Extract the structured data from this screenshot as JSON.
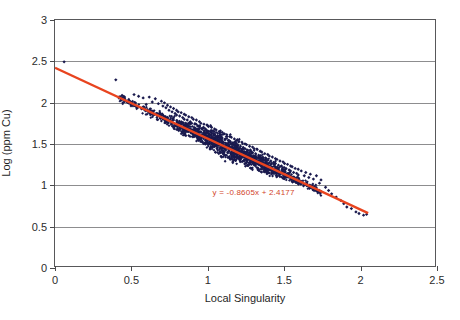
{
  "chart_data": {
    "type": "scatter",
    "title": "",
    "xlabel": "Local Singularity",
    "ylabel": "Log (ppm Cu)",
    "xlim": [
      0,
      2.5
    ],
    "ylim": [
      0,
      3
    ],
    "xticks": [
      "0",
      "0.5",
      "1",
      "1.5",
      "2",
      "2.5"
    ],
    "xtick_values": [
      0,
      0.5,
      1,
      1.5,
      2,
      2.5
    ],
    "yticks": [
      "0",
      "0.5",
      "1",
      "1.5",
      "2",
      "2.5",
      "3"
    ],
    "ytick_values": [
      0,
      0.5,
      1,
      1.5,
      2,
      2.5,
      3
    ],
    "grid": "horizontal",
    "legend": "none",
    "point_color": "#1a1a4e",
    "trendline_color": "#e8441f",
    "trendline": {
      "equation": "y = -0.8605x + 2.4177",
      "slope": -0.8605,
      "intercept": 2.4177,
      "x_start": 0.0,
      "x_end": 2.06
    },
    "annotation": {
      "text": "y = -0.8605x + 2.4177",
      "x": 1.3,
      "y": 0.92
    },
    "series": [
      {
        "name": "Log (ppm Cu) vs Local Singularity",
        "marker": "diamond",
        "points": [
          [
            0.06,
            2.49
          ],
          [
            0.4,
            2.27
          ],
          [
            0.46,
            2.03
          ],
          [
            0.52,
            2.09
          ],
          [
            0.55,
            2.07
          ],
          [
            0.58,
            2.05
          ],
          [
            0.6,
            1.97
          ],
          [
            0.62,
            2.06
          ],
          [
            0.64,
            2.0
          ],
          [
            0.66,
            2.04
          ],
          [
            0.68,
            1.98
          ],
          [
            0.7,
            2.01
          ],
          [
            0.71,
            1.95
          ],
          [
            0.72,
            1.99
          ],
          [
            0.73,
            1.93
          ],
          [
            0.74,
            1.96
          ],
          [
            0.75,
            1.9
          ],
          [
            0.76,
            1.94
          ],
          [
            0.77,
            1.88
          ],
          [
            0.78,
            1.92
          ],
          [
            0.79,
            1.86
          ],
          [
            0.8,
            1.9
          ],
          [
            0.8,
            1.84
          ],
          [
            0.81,
            1.88
          ],
          [
            0.82,
            1.83
          ],
          [
            0.83,
            1.87
          ],
          [
            0.84,
            1.81
          ],
          [
            0.85,
            1.85
          ],
          [
            0.85,
            1.79
          ],
          [
            0.86,
            1.84
          ],
          [
            0.87,
            1.78
          ],
          [
            0.88,
            1.82
          ],
          [
            0.89,
            1.76
          ],
          [
            0.9,
            1.81
          ],
          [
            0.9,
            1.74
          ],
          [
            0.91,
            1.79
          ],
          [
            0.92,
            1.73
          ],
          [
            0.93,
            1.78
          ],
          [
            0.94,
            1.71
          ],
          [
            0.95,
            1.76
          ],
          [
            0.95,
            1.7
          ],
          [
            0.96,
            1.74
          ],
          [
            0.97,
            1.68
          ],
          [
            0.98,
            1.73
          ],
          [
            0.99,
            1.67
          ],
          [
            1.0,
            1.72
          ],
          [
            1.0,
            1.65
          ],
          [
            1.01,
            1.7
          ],
          [
            1.02,
            1.64
          ],
          [
            1.03,
            1.69
          ],
          [
            1.04,
            1.62
          ],
          [
            1.05,
            1.67
          ],
          [
            1.05,
            1.61
          ],
          [
            1.06,
            1.66
          ],
          [
            1.07,
            1.59
          ],
          [
            1.08,
            1.64
          ],
          [
            1.09,
            1.58
          ],
          [
            1.1,
            1.63
          ],
          [
            1.1,
            1.56
          ],
          [
            1.11,
            1.61
          ],
          [
            1.12,
            1.55
          ],
          [
            1.13,
            1.6
          ],
          [
            1.14,
            1.53
          ],
          [
            1.15,
            1.58
          ],
          [
            1.15,
            1.52
          ],
          [
            1.16,
            1.57
          ],
          [
            1.17,
            1.5
          ],
          [
            1.18,
            1.55
          ],
          [
            1.19,
            1.49
          ],
          [
            1.2,
            1.54
          ],
          [
            1.2,
            1.47
          ],
          [
            1.21,
            1.52
          ],
          [
            1.22,
            1.46
          ],
          [
            1.23,
            1.51
          ],
          [
            1.24,
            1.44
          ],
          [
            1.25,
            1.49
          ],
          [
            1.25,
            1.43
          ],
          [
            1.26,
            1.48
          ],
          [
            1.27,
            1.41
          ],
          [
            1.28,
            1.46
          ],
          [
            1.29,
            1.4
          ],
          [
            1.3,
            1.45
          ],
          [
            1.3,
            1.38
          ],
          [
            1.31,
            1.43
          ],
          [
            1.32,
            1.37
          ],
          [
            1.33,
            1.42
          ],
          [
            1.34,
            1.35
          ],
          [
            1.35,
            1.4
          ],
          [
            1.35,
            1.34
          ],
          [
            1.36,
            1.39
          ],
          [
            1.37,
            1.32
          ],
          [
            1.38,
            1.37
          ],
          [
            1.39,
            1.31
          ],
          [
            1.4,
            1.36
          ],
          [
            1.4,
            1.29
          ],
          [
            1.41,
            1.34
          ],
          [
            1.42,
            1.28
          ],
          [
            1.43,
            1.33
          ],
          [
            1.44,
            1.26
          ],
          [
            1.45,
            1.31
          ],
          [
            1.45,
            1.25
          ],
          [
            1.46,
            1.3
          ],
          [
            1.47,
            1.23
          ],
          [
            1.48,
            1.28
          ],
          [
            1.49,
            1.22
          ],
          [
            1.5,
            1.27
          ],
          [
            1.5,
            1.2
          ],
          [
            1.51,
            1.25
          ],
          [
            1.52,
            1.19
          ],
          [
            1.53,
            1.24
          ],
          [
            1.54,
            1.17
          ],
          [
            1.55,
            1.22
          ],
          [
            1.55,
            1.16
          ],
          [
            1.56,
            1.21
          ],
          [
            1.57,
            1.14
          ],
          [
            1.58,
            1.19
          ],
          [
            1.59,
            1.13
          ],
          [
            1.6,
            1.18
          ],
          [
            1.6,
            1.11
          ],
          [
            1.62,
            1.16
          ],
          [
            1.64,
            1.1
          ],
          [
            1.65,
            1.14
          ],
          [
            1.67,
            1.08
          ],
          [
            1.68,
            1.12
          ],
          [
            1.7,
            1.06
          ],
          [
            1.72,
            1.1
          ],
          [
            1.74,
            1.01
          ],
          [
            1.75,
            1.05
          ],
          [
            1.78,
            0.96
          ],
          [
            1.8,
            0.92
          ],
          [
            1.82,
            0.88
          ],
          [
            1.85,
            0.84
          ],
          [
            1.88,
            0.8
          ],
          [
            1.9,
            0.76
          ],
          [
            1.92,
            0.72
          ],
          [
            1.95,
            0.7
          ],
          [
            1.98,
            0.66
          ],
          [
            2.0,
            0.64
          ],
          [
            2.03,
            0.62
          ],
          [
            2.05,
            0.63
          ]
        ]
      }
    ],
    "cluster": {
      "description": "dense elongated cloud of navy diamond markers following the regression line",
      "x_range": [
        0.42,
        1.75
      ],
      "density_peak_x": 1.15,
      "vertical_spread": 0.11,
      "n_points_approx": 2600
    }
  }
}
